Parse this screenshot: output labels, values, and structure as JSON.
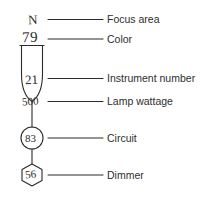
{
  "diagram": {
    "stroke_color": "#2b2b2b",
    "text_color": "#2e2e2e",
    "background": "#ffffff",
    "annotations": [
      {
        "id": "focus-area",
        "symbol_text": "N",
        "label": "Focus area",
        "shape": "letter"
      },
      {
        "id": "color",
        "symbol_text": "79",
        "label": "Color",
        "shape": "number"
      },
      {
        "id": "instrument-number",
        "symbol_text": "21",
        "label": "Instrument number",
        "shape": "instrument-body"
      },
      {
        "id": "lamp-wattage",
        "symbol_text": "500",
        "label": "Lamp wattage",
        "shape": "instrument-body"
      },
      {
        "id": "circuit",
        "symbol_text": "83",
        "label": "Circuit",
        "shape": "circle"
      },
      {
        "id": "dimmer",
        "symbol_text": "56",
        "label": "Dimmer",
        "shape": "hexagon"
      }
    ]
  }
}
